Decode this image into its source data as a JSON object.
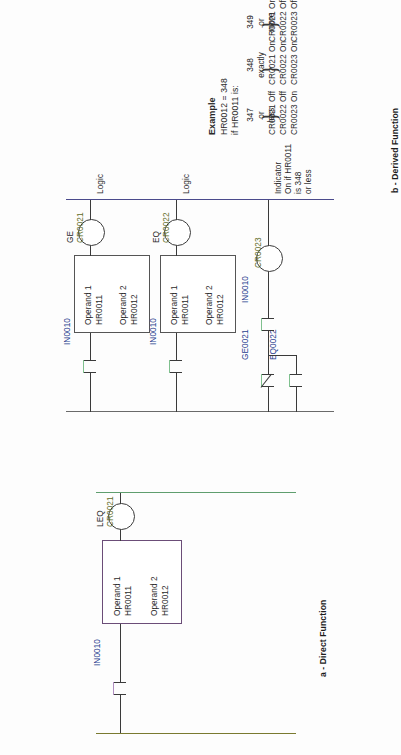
{
  "document": {
    "title": "Ladder logic comparison example",
    "orientation": "rotated-90",
    "colors": {
      "coil_tag": "#5d6b24",
      "contact_tag": "#28408f",
      "function_box_border": "#6b4d78",
      "power_rail_left": "#7a7a30",
      "power_rail_right": "#5f9e6e",
      "logic_bus": "#4a4a8c"
    }
  },
  "section_a": {
    "caption": "a - Direct Function",
    "contact": {
      "tag": "IN0010",
      "type": "normally-open"
    },
    "function_box": {
      "operand1_label": "Operand 1",
      "operand1_value": "HR0011",
      "operand2_label": "Operand 2",
      "operand2_value": "HR0012"
    },
    "coil": {
      "function": "LEQ",
      "tag": "CR0021"
    }
  },
  "section_b": {
    "caption": "b - Derived Function",
    "rungs": [
      {
        "contact": {
          "tag": "IN0010",
          "type": "normally-open"
        },
        "function_box": {
          "operand1_label": "Operand 1",
          "operand1_value": "HR0011",
          "operand2_label": "Operand 2",
          "operand2_value": "HR0012"
        },
        "coil": {
          "function": "GE",
          "tag": "CR0021"
        },
        "annotation": "Logic"
      },
      {
        "contact": {
          "tag": "IN0010",
          "type": "normally-open"
        },
        "function_box": {
          "operand1_label": "Operand 1",
          "operand1_value": "HR0011",
          "operand2_label": "Operand 2",
          "operand2_value": "HR0012"
        },
        "coil": {
          "function": "EQ",
          "tag": "CR0022"
        },
        "annotation": "Logic"
      },
      {
        "contact": {
          "tag": "IN0010",
          "type": "normally-open"
        },
        "branch_contacts": [
          {
            "tag": "GE0021",
            "type": "normally-closed"
          },
          {
            "tag": "EQ0022",
            "type": "normally-open"
          }
        ],
        "coil": {
          "function": "",
          "tag": "CR0023"
        },
        "annotation": "Indicator\nOn if HR0011\nis 348\nor less"
      }
    ]
  },
  "example": {
    "heading": "Example",
    "line1": "HR0012 = 348",
    "line2": "if HR0011 is:",
    "cases": [
      {
        "condition": "347\nor\nless",
        "results": [
          "CR0021 Off",
          "CR0022 Off",
          "CR0023 On"
        ]
      },
      {
        "condition": "348\nexactly",
        "results": [
          "CR0021 On",
          "CR0022 On",
          "CR0023 On"
        ]
      },
      {
        "condition": "349\nor\nmore",
        "results": [
          "CR0021 On",
          "CR0022 Off",
          "CR0023 Off"
        ]
      }
    ]
  }
}
